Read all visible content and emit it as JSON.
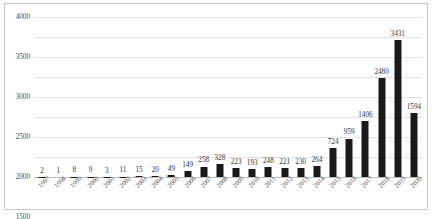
{
  "chart_data": {
    "type": "bar",
    "title": "",
    "subtitle": "",
    "xlabel": "",
    "ylabel": "",
    "ylim": [
      0,
      4000
    ],
    "ytick_step": 500,
    "yticks": [
      "0",
      "500",
      "1000",
      "1500",
      "2000",
      "2500",
      "3000",
      "3500",
      "4000"
    ],
    "grid": true,
    "legend": false,
    "bar_color": "#1a1a1a",
    "grid_color": "#e2e2e2",
    "categories": [
      "1997",
      "1998",
      "1999",
      "2000",
      "2001",
      "2002",
      "2003",
      "2004",
      "2005",
      "2006",
      "2007",
      "2008",
      "2009",
      "2010",
      "2011",
      "2012",
      "2013",
      "2014",
      "2015",
      "2016",
      "2017",
      "2018",
      "2019",
      "2020"
    ],
    "values": [
      2,
      1,
      8,
      9,
      3,
      11,
      15,
      20,
      49,
      149,
      258,
      328,
      223,
      193,
      248,
      221,
      230,
      264,
      724,
      959,
      1406,
      2480,
      3431,
      1594
    ],
    "data_labels": [
      "2",
      "1",
      "8",
      "9",
      "3",
      "11",
      "15",
      "20",
      "49",
      "149",
      "258",
      "328",
      "223",
      "193",
      "248",
      "221",
      "230",
      "264",
      "724",
      "959",
      "1406",
      "2480",
      "3431",
      "1594"
    ]
  }
}
